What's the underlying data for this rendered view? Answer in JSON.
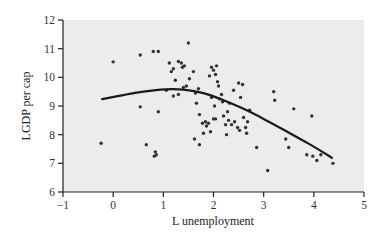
{
  "chart_data": {
    "type": "scatter",
    "title": "",
    "xlabel": "L unemployment",
    "ylabel": "LGDP per cap",
    "xlim": [
      -1,
      5
    ],
    "ylim": [
      6,
      12
    ],
    "xticks": [
      -1,
      0,
      1,
      2,
      3,
      4,
      5
    ],
    "yticks": [
      6,
      7,
      8,
      9,
      10,
      11,
      12
    ],
    "grid": false,
    "legend": null,
    "background": "#ececec",
    "point_color": "#333333",
    "line_color": "#1a1a1a",
    "series": [
      {
        "name": "observations",
        "kind": "scatter",
        "points": [
          [
            -0.24,
            7.7
          ],
          [
            0.0,
            10.54
          ],
          [
            0.54,
            10.78
          ],
          [
            0.8,
            10.9
          ],
          [
            0.9,
            10.9
          ],
          [
            0.54,
            8.97
          ],
          [
            0.66,
            7.65
          ],
          [
            0.84,
            7.4
          ],
          [
            0.82,
            7.25
          ],
          [
            0.86,
            7.3
          ],
          [
            0.9,
            8.8
          ],
          [
            1.06,
            9.55
          ],
          [
            1.12,
            10.5
          ],
          [
            1.16,
            10.2
          ],
          [
            1.2,
            10.3
          ],
          [
            1.24,
            9.9
          ],
          [
            1.3,
            10.55
          ],
          [
            1.36,
            10.5
          ],
          [
            1.38,
            10.35
          ],
          [
            1.42,
            10.4
          ],
          [
            1.46,
            9.7
          ],
          [
            1.5,
            11.2
          ],
          [
            1.52,
            9.95
          ],
          [
            1.6,
            10.2
          ],
          [
            1.2,
            9.35
          ],
          [
            1.3,
            9.4
          ],
          [
            1.4,
            9.65
          ],
          [
            1.64,
            9.45
          ],
          [
            1.7,
            9.6
          ],
          [
            1.66,
            9.1
          ],
          [
            1.72,
            8.7
          ],
          [
            1.78,
            8.4
          ],
          [
            1.62,
            7.85
          ],
          [
            1.72,
            7.65
          ],
          [
            1.8,
            8.05
          ],
          [
            1.86,
            8.3
          ],
          [
            1.92,
            10.05
          ],
          [
            1.96,
            10.35
          ],
          [
            2.0,
            10.25
          ],
          [
            2.04,
            10.1
          ],
          [
            2.08,
            9.85
          ],
          [
            2.06,
            10.4
          ],
          [
            1.96,
            9.3
          ],
          [
            2.02,
            9.0
          ],
          [
            2.04,
            8.55
          ],
          [
            2.12,
            9.25
          ],
          [
            2.18,
            9.15
          ],
          [
            2.2,
            8.65
          ],
          [
            2.24,
            8.35
          ],
          [
            2.26,
            8.0
          ],
          [
            2.3,
            8.5
          ],
          [
            2.36,
            8.35
          ],
          [
            2.42,
            8.45
          ],
          [
            1.9,
            8.4
          ],
          [
            1.94,
            8.1
          ],
          [
            2.1,
            9.7
          ],
          [
            2.16,
            9.4
          ],
          [
            2.4,
            9.55
          ],
          [
            2.5,
            9.8
          ],
          [
            2.58,
            9.75
          ],
          [
            2.54,
            9.3
          ],
          [
            2.6,
            8.6
          ],
          [
            2.64,
            8.25
          ],
          [
            2.68,
            8.45
          ],
          [
            2.72,
            8.85
          ],
          [
            2.48,
            8.25
          ],
          [
            2.52,
            8.15
          ],
          [
            2.66,
            8.05
          ],
          [
            2.86,
            7.55
          ],
          [
            3.2,
            9.5
          ],
          [
            3.22,
            9.2
          ],
          [
            3.6,
            8.9
          ],
          [
            3.96,
            8.65
          ],
          [
            3.44,
            7.85
          ],
          [
            3.5,
            7.55
          ],
          [
            3.08,
            6.75
          ],
          [
            3.86,
            7.3
          ],
          [
            3.98,
            7.25
          ],
          [
            4.06,
            7.1
          ],
          [
            4.14,
            7.3
          ],
          [
            4.38,
            7.0
          ],
          [
            2.28,
            8.8
          ],
          [
            2.0,
            8.55
          ],
          [
            1.84,
            8.45
          ],
          [
            2.32,
            9.1
          ]
        ]
      },
      {
        "name": "fitted curve",
        "kind": "line",
        "points": [
          [
            -0.22,
            9.24
          ],
          [
            0.2,
            9.38
          ],
          [
            0.6,
            9.5
          ],
          [
            1.04,
            9.58
          ],
          [
            1.4,
            9.57
          ],
          [
            1.8,
            9.45
          ],
          [
            2.2,
            9.2
          ],
          [
            2.6,
            8.9
          ],
          [
            3.0,
            8.55
          ],
          [
            3.4,
            8.17
          ],
          [
            3.8,
            7.78
          ],
          [
            4.1,
            7.48
          ],
          [
            4.36,
            7.19
          ]
        ]
      }
    ]
  }
}
